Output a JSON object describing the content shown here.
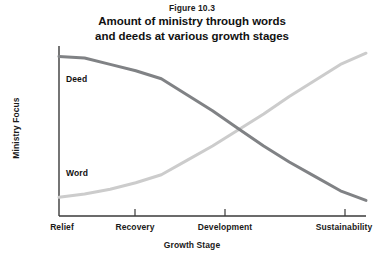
{
  "figure": {
    "number": "Figure 10.3",
    "title_line1": "Amount of ministry through words",
    "title_line2": "and deeds at various growth stages"
  },
  "chart_data": {
    "type": "line",
    "title": "Amount of ministry through words and deeds at various growth stages",
    "subtitle": "Figure 10.3",
    "xlabel": "Growth Stage",
    "ylabel": "Ministry Focus",
    "categories": [
      "Relief",
      "Recovery",
      "Development",
      "Sustainability"
    ],
    "x": [
      0,
      1,
      2,
      3
    ],
    "xlim": [
      0,
      3
    ],
    "ylim": [
      0,
      100
    ],
    "grid": false,
    "legend_position": "inline-annotations",
    "axis_ticks_y": false,
    "series": [
      {
        "name": "Deed",
        "color": "#808285",
        "values": [
          96,
          82,
          40,
          6
        ],
        "points": [
          {
            "x": 0.0,
            "y": 96
          },
          {
            "x": 0.25,
            "y": 95
          },
          {
            "x": 0.5,
            "y": 91
          },
          {
            "x": 0.75,
            "y": 87
          },
          {
            "x": 1.0,
            "y": 82
          },
          {
            "x": 1.25,
            "y": 72
          },
          {
            "x": 1.5,
            "y": 62
          },
          {
            "x": 1.75,
            "y": 51
          },
          {
            "x": 2.0,
            "y": 40
          },
          {
            "x": 2.25,
            "y": 30
          },
          {
            "x": 2.5,
            "y": 21
          },
          {
            "x": 2.75,
            "y": 12
          },
          {
            "x": 3.0,
            "y": 6
          }
        ]
      },
      {
        "name": "Word",
        "color": "#cccccc",
        "values": [
          8,
          22,
          60,
          98
        ],
        "points": [
          {
            "x": 0.0,
            "y": 8
          },
          {
            "x": 0.25,
            "y": 10
          },
          {
            "x": 0.5,
            "y": 13
          },
          {
            "x": 0.75,
            "y": 17
          },
          {
            "x": 1.0,
            "y": 22
          },
          {
            "x": 1.25,
            "y": 31
          },
          {
            "x": 1.5,
            "y": 40
          },
          {
            "x": 1.75,
            "y": 50
          },
          {
            "x": 2.0,
            "y": 60
          },
          {
            "x": 2.25,
            "y": 71
          },
          {
            "x": 2.5,
            "y": 81
          },
          {
            "x": 2.75,
            "y": 91
          },
          {
            "x": 3.0,
            "y": 98
          }
        ]
      }
    ],
    "annotations": [
      {
        "text": "Deed",
        "series": "Deed"
      },
      {
        "text": "Word",
        "series": "Word"
      }
    ],
    "crossing_point": {
      "x": 1.73,
      "y": 49
    }
  },
  "axes": {
    "axis_color": "#3a3a3a",
    "x_tick_labels": [
      {
        "label": "Relief",
        "x_px": 62
      },
      {
        "label": "Recovery",
        "x_px": 135
      },
      {
        "label": "Development",
        "x_px": 225
      },
      {
        "label": "Sustainability",
        "x_px": 344
      }
    ],
    "y_title": "Ministry Focus",
    "x_title": "Growth Stage"
  },
  "colors": {
    "background": "#ffffff",
    "text": "#111111",
    "deed_series": "#808285",
    "word_series": "#cccccc",
    "axis": "#3a3a3a"
  }
}
